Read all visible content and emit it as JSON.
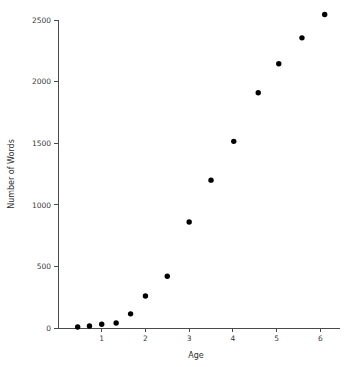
{
  "chart_data": {
    "type": "scatter",
    "title": "",
    "xlabel": "Age",
    "ylabel": "Number of Words",
    "xlim": [
      0,
      6.45
    ],
    "ylim": [
      0,
      2600
    ],
    "xticks": [
      1,
      2,
      3,
      4,
      5,
      6
    ],
    "xtick_labels": [
      "1",
      "2",
      "3",
      "4",
      "5",
      "6"
    ],
    "yticks": [
      0,
      500,
      1000,
      1500,
      2000,
      2500
    ],
    "ytick_labels": [
      "0",
      "500",
      "1000",
      "1500",
      "2000",
      "2500"
    ],
    "grid": false,
    "legend": false,
    "marker": "filled-circle",
    "marker_color": "#000000",
    "x": [
      0.45,
      0.72,
      1.0,
      1.33,
      1.66,
      2.0,
      2.5,
      3.0,
      3.5,
      4.02,
      4.58,
      5.05,
      5.58,
      6.1
    ],
    "y": [
      8,
      16,
      30,
      40,
      115,
      260,
      420,
      860,
      1200,
      1515,
      1910,
      2145,
      2355,
      2545
    ],
    "points": [
      {
        "x": 0.45,
        "y": 8
      },
      {
        "x": 0.72,
        "y": 16
      },
      {
        "x": 1.0,
        "y": 30
      },
      {
        "x": 1.33,
        "y": 40
      },
      {
        "x": 1.66,
        "y": 115
      },
      {
        "x": 2.0,
        "y": 260
      },
      {
        "x": 2.5,
        "y": 420
      },
      {
        "x": 3.0,
        "y": 860
      },
      {
        "x": 3.5,
        "y": 1200
      },
      {
        "x": 4.02,
        "y": 1515
      },
      {
        "x": 4.58,
        "y": 1910
      },
      {
        "x": 5.05,
        "y": 2145
      },
      {
        "x": 5.58,
        "y": 2355
      },
      {
        "x": 6.1,
        "y": 2545
      }
    ]
  },
  "axes": {
    "x_title": "Age",
    "y_title": "Number of Words"
  }
}
